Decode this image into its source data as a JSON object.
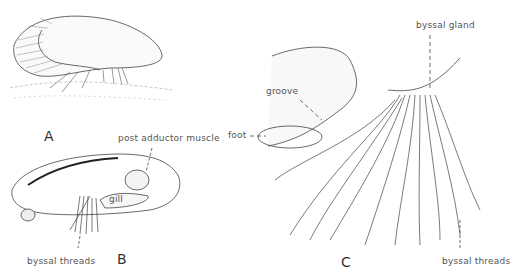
{
  "figure": {
    "panels": [
      {
        "id": "A",
        "letter": "A",
        "description": "mussel attached to substrate by byssal threads"
      },
      {
        "id": "B",
        "letter": "B",
        "description": "interior view of mussel",
        "labels": {
          "post_adductor": "post adductor muscle",
          "gill": "gill",
          "byssal_threads": "byssal threads"
        }
      },
      {
        "id": "C",
        "letter": "C",
        "description": "foot and byssus detail",
        "labels": {
          "byssal_gland": "byssal gland",
          "groove": "groove",
          "foot": "foot",
          "byssal_threads": "byssal threads"
        }
      }
    ]
  }
}
